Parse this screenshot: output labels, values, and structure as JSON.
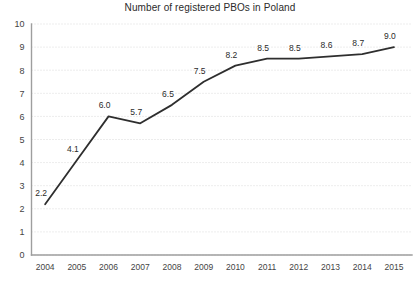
{
  "chart_data": {
    "type": "line",
    "title": "Number of registered PBOs in Poland",
    "xlabel": "",
    "ylabel": "",
    "categories": [
      "2004",
      "2005",
      "2006",
      "2007",
      "2008",
      "2009",
      "2010",
      "2011",
      "2012",
      "2013",
      "2014",
      "2015"
    ],
    "values": [
      2.2,
      4.1,
      6.0,
      5.7,
      6.5,
      7.5,
      8.2,
      8.5,
      8.5,
      8.6,
      8.7,
      9.0
    ],
    "point_labels": [
      "2.2",
      "4.1",
      "6.0",
      "5.7",
      "6.5",
      "7.5",
      "8.2",
      "8.5",
      "8.5",
      "8.6",
      "8.7",
      "9.0"
    ],
    "ylim": [
      0,
      10
    ],
    "ytick_step": 1,
    "ytick_labels": [
      "0",
      "1",
      "2",
      "3",
      "4",
      "5",
      "6",
      "7",
      "8",
      "9",
      "10"
    ],
    "grid": true,
    "grid_axis": "y",
    "legend": false,
    "series_color": "#2e2e2e",
    "grid_color": "#d9d9d9",
    "axis_color": "#9e9e9e",
    "background_color": "#ffffff",
    "text_color": "#2b2b2b"
  }
}
